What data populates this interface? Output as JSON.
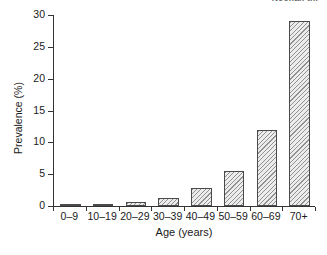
{
  "figure": {
    "clipped_caption": "Noonan thr"
  },
  "chart_data": {
    "type": "bar",
    "title": "",
    "xlabel": "Age (years)",
    "ylabel": "Prevalence (%)",
    "categories": [
      "0–9",
      "10–19",
      "20–29",
      "30–39",
      "40–49",
      "50–59",
      "60–69",
      "70+"
    ],
    "values": [
      0.1,
      0.1,
      0.6,
      1.2,
      2.8,
      5.5,
      12.0,
      29.0
    ],
    "ylim": [
      0,
      30
    ],
    "yticks": [
      0,
      5,
      10,
      15,
      20,
      25,
      30
    ],
    "ytick_labels": [
      "0",
      "5",
      "10",
      "15",
      "20",
      "25",
      "30"
    ],
    "grid": false,
    "legend": null,
    "bar_fill": "hatched-grey",
    "axis_color": "#333333"
  }
}
